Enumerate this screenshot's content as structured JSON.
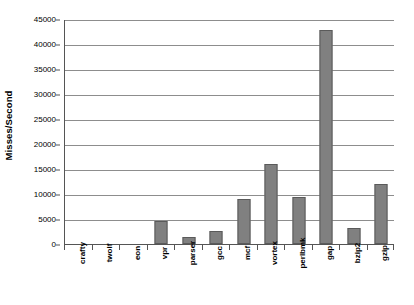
{
  "chart_data": {
    "type": "bar",
    "title": "",
    "xlabel": "",
    "ylabel": "Misses/Second",
    "categories": [
      "crafty",
      "twolf",
      "eon",
      "vpr",
      "parser",
      "gcc",
      "mcf",
      "vortex",
      "perlbmk",
      "gap",
      "bzip2",
      "gzip"
    ],
    "values": [
      0,
      0,
      0,
      4600,
      1400,
      2600,
      9000,
      16000,
      9400,
      42800,
      3200,
      12000
    ],
    "ylim": [
      0,
      45000
    ],
    "ytick_labels": [
      "0",
      "5000",
      "10000",
      "15000",
      "20000",
      "25000",
      "30000",
      "35000",
      "40000",
      "45000"
    ],
    "ytick_values": [
      0,
      5000,
      10000,
      15000,
      20000,
      25000,
      30000,
      35000,
      40000,
      45000
    ],
    "grid": true,
    "legend": false,
    "bar_color": "#808080",
    "bar_border_color": "#5a5a5a",
    "gridline_color": "#8d8d8d",
    "axis_color": "#555555",
    "background_color": "#ffffff"
  }
}
